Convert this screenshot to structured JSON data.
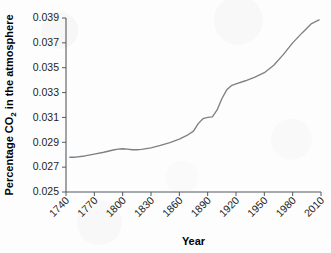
{
  "chart_data": {
    "type": "line",
    "title": "",
    "xlabel": "Year",
    "ylabel_parts": {
      "before": "Percentage CO",
      "subscript": "2",
      "after": " in the atmosphere"
    },
    "ylabel": "Percentage CO2 in the atmosphere",
    "xlim": [
      1740,
      2010
    ],
    "ylim": [
      0.025,
      0.039
    ],
    "grid": false,
    "legend": null,
    "xticks": [
      1740,
      1770,
      1800,
      1830,
      1860,
      1890,
      1920,
      1950,
      1980,
      2010
    ],
    "xtick_labels": [
      "1740",
      "1770",
      "1800",
      "1830",
      "1860",
      "1890",
      "1920",
      "1950",
      "1980",
      "2010"
    ],
    "xtick_rotation_deg": 45,
    "yticks": [
      0.025,
      0.027,
      0.029,
      0.031,
      0.033,
      0.035,
      0.037,
      0.039
    ],
    "ytick_labels": [
      "0.025",
      "0.027",
      "0.029",
      "0.031",
      "0.033",
      "0.035",
      "0.037",
      "0.039"
    ],
    "series": [
      {
        "name": "Atmospheric CO2 percentage",
        "color": "#7d8185",
        "x": [
          1744,
          1750,
          1760,
          1770,
          1780,
          1790,
          1795,
          1800,
          1805,
          1810,
          1815,
          1820,
          1830,
          1840,
          1850,
          1860,
          1868,
          1875,
          1880,
          1885,
          1890,
          1895,
          1900,
          1905,
          1910,
          1915,
          1920,
          1930,
          1940,
          1950,
          1960,
          1970,
          1980,
          1990,
          2000,
          2008
        ],
        "y": [
          0.0278,
          0.0278,
          0.0279,
          0.02805,
          0.0282,
          0.02838,
          0.02845,
          0.02848,
          0.02845,
          0.0284,
          0.0284,
          0.02843,
          0.02855,
          0.02875,
          0.02898,
          0.02925,
          0.02955,
          0.0299,
          0.0305,
          0.0309,
          0.031,
          0.03105,
          0.0316,
          0.0325,
          0.0332,
          0.03355,
          0.0337,
          0.03395,
          0.03425,
          0.0346,
          0.0352,
          0.03605,
          0.037,
          0.0378,
          0.03855,
          0.03885
        ]
      }
    ],
    "axis_color": "#555a5e",
    "background_color": "#fdfdfd"
  },
  "figure": {
    "width": 331,
    "height": 253,
    "plot_left": 66,
    "plot_right": 321,
    "plot_top": 18,
    "plot_bottom": 192
  }
}
